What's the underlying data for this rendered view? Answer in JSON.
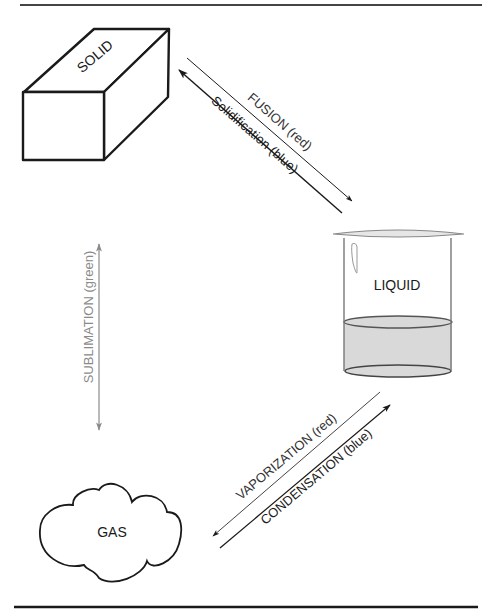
{
  "diagram": {
    "title": "",
    "states": {
      "solid": {
        "label": "SOLID"
      },
      "liquid": {
        "label": "LIQUID"
      },
      "gas": {
        "label": "GAS"
      }
    },
    "transitions": {
      "fusion": {
        "label": "FUSION (red)",
        "from": "SOLID",
        "to": "LIQUID"
      },
      "solidification": {
        "label": "Solidification (blue)",
        "from": "LIQUID",
        "to": "SOLID"
      },
      "sublimation": {
        "label": "SUBLIMATION (green)",
        "from": "SOLID",
        "to": "GAS",
        "bidirectional": true
      },
      "vaporization": {
        "label": "VAPORIZATION (red)",
        "from": "LIQUID",
        "to": "GAS"
      },
      "condensation": {
        "label": "CONDENSATION (blue)",
        "from": "GAS",
        "to": "LIQUID"
      }
    },
    "colors": {
      "stroke": "#1a1a1a",
      "rule": "#333333",
      "sublimation": "#8a8a8a",
      "liquid_fill": "#d9d9d9"
    }
  }
}
